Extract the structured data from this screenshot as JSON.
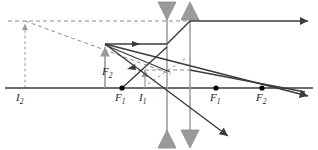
{
  "figure": {
    "width": 318,
    "height": 150,
    "background": "#ffffff"
  },
  "colors": {
    "axis": "#3b3b3b",
    "ray_solid": "#3b3b3b",
    "ray_dashed": "#6f6f6f",
    "lens_fill": "#9a9a9a",
    "lens_stroke": "#8a8a8a",
    "object_arrow": "#9a9a9a",
    "dot": "#000000",
    "label_text": "#231f20"
  },
  "axis": {
    "name": "optical-axis",
    "y": 88,
    "x_start": 5,
    "x_end": 313
  },
  "elements": {
    "lens_diverging": {
      "name": "diverging-lens",
      "x": 167,
      "top": 3,
      "bottom": 147,
      "arrow_style": "inward-triangles"
    },
    "lens_converging": {
      "name": "converging-lens",
      "x": 190,
      "top": 3,
      "bottom": 147,
      "arrow_style": "outward-triangles"
    }
  },
  "points": [
    {
      "label": "F",
      "sub": "2",
      "x": 112,
      "y": 74,
      "dot": false,
      "name": "focal-point-f2-left-upper"
    },
    {
      "label": "F",
      "sub": "1",
      "x": 122,
      "y": 88,
      "dot": true,
      "name": "focal-point-f1-left"
    },
    {
      "label": "I",
      "sub": "1",
      "x": 145,
      "y": 88,
      "dot": false,
      "name": "image-i1"
    },
    {
      "label": "F",
      "sub": "1",
      "x": 216,
      "y": 88,
      "dot": true,
      "name": "focal-point-f1-right"
    },
    {
      "label": "F",
      "sub": "2",
      "x": 262,
      "y": 88,
      "dot": true,
      "name": "focal-point-f2-right"
    },
    {
      "label": "I",
      "sub": "2",
      "x": 25,
      "y": 88,
      "dot": false,
      "name": "image-i2"
    }
  ],
  "labels": {
    "i2": {
      "text": "I",
      "sub": "2",
      "x": 18,
      "y": 92
    },
    "f2_left": {
      "text": "F",
      "sub": "2",
      "x": 104,
      "y": 67
    },
    "f1_left": {
      "text": "F",
      "sub": "1",
      "x": 115,
      "y": 92
    },
    "i1": {
      "text": "I",
      "sub": "1",
      "x": 138,
      "y": 92
    },
    "f1_right": {
      "text": "F",
      "sub": "1",
      "x": 210,
      "y": 92
    },
    "f2_right": {
      "text": "F",
      "sub": "2",
      "x": 256,
      "y": 92
    }
  },
  "arrows": {
    "object_solid": {
      "name": "object-arrow",
      "x": 105,
      "y_base": 88,
      "y_tip": 44
    },
    "image_i1_small": {
      "name": "image-i1-arrow",
      "x": 145,
      "y_base": 88,
      "y_tip": 68
    },
    "image_i2_dashed": {
      "name": "image-i2-arrow",
      "x": 25,
      "y_base": 88,
      "y_tip": 21
    }
  },
  "rays": {
    "dashed_horizontal_top": {
      "name": "dashed-construction-top",
      "y": 21,
      "x1": 8,
      "x2": 190
    },
    "dashed_diagonal": {
      "name": "dashed-construction-diagonal",
      "points": "25,21 167,72"
    },
    "dashed_horizontal_mid": {
      "name": "dashed-construction-mid",
      "y": 70,
      "x1": 140,
      "x2": 190
    },
    "ray_parallel_in": {
      "name": "incident-parallel-ray",
      "points": "105,44 167,44"
    },
    "ray_to_exit_top": {
      "name": "ray-to-top-exit",
      "points": "167,44 190,21"
    },
    "ray_exit_horizontal": {
      "name": "exit-horizontal-ray",
      "points": "190,21 310,21"
    },
    "ray_down_1": {
      "name": "ray-down-upper",
      "points": "105,44 310,96"
    },
    "ray_down_2": {
      "name": "ray-down-lower",
      "points": "105,44 230,138"
    },
    "ray_up_from_i1": {
      "name": "ray-from-i1-up",
      "points": "122,88 167,47"
    },
    "ray_exit_mid": {
      "name": "exit-mid-ray",
      "points": "190,70 305,92"
    }
  }
}
